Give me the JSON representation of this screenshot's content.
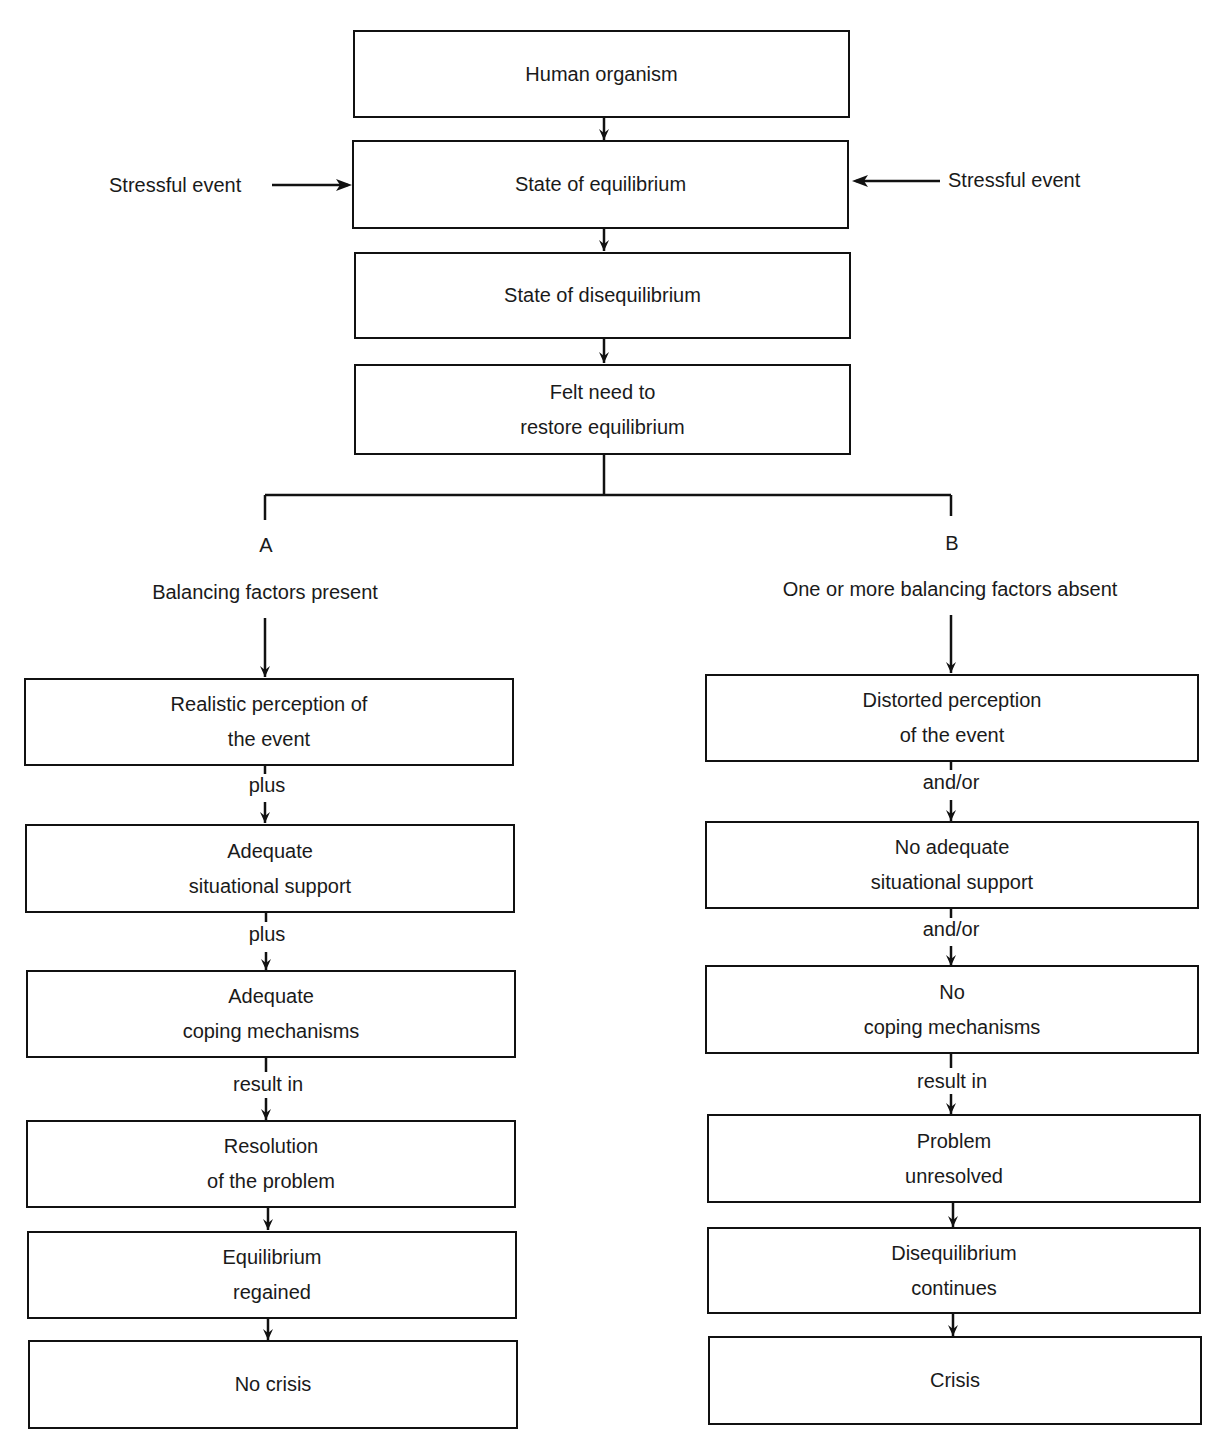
{
  "top_flow": {
    "human_organism": "Human organism",
    "state_equilibrium": "State of equilibrium",
    "state_disequilibrium": "State of disequilibrium",
    "felt_need_line1": "Felt need to",
    "felt_need_line2": "restore equilibrium"
  },
  "stressors": {
    "left": "Stressful event",
    "right": "Stressful event"
  },
  "branch_a": {
    "letter": "A",
    "heading": "Balancing factors present",
    "boxes": [
      {
        "line1": "Realistic perception of",
        "line2": "the event"
      },
      {
        "line1": "Adequate",
        "line2": "situational support"
      },
      {
        "line1": "Adequate",
        "line2": "coping mechanisms"
      },
      {
        "line1": "Resolution",
        "line2": "of the problem"
      },
      {
        "line1": "Equilibrium",
        "line2": "regained"
      },
      {
        "line1": "No crisis",
        "line2": ""
      }
    ],
    "connectors": [
      "plus",
      "plus",
      "result in"
    ]
  },
  "branch_b": {
    "letter": "B",
    "heading": "One or more balancing factors absent",
    "boxes": [
      {
        "line1": "Distorted perception",
        "line2": "of the event"
      },
      {
        "line1": "No adequate",
        "line2": "situational support"
      },
      {
        "line1": "No",
        "line2": "coping mechanisms"
      },
      {
        "line1": "Problem",
        "line2": "unresolved"
      },
      {
        "line1": "Disequilibrium",
        "line2": "continues"
      },
      {
        "line1": "Crisis",
        "line2": ""
      }
    ],
    "connectors": [
      "and/or",
      "and/or",
      "result in"
    ]
  },
  "colors": {
    "line": "#111111",
    "text": "#1a1a1a",
    "background": "#ffffff"
  }
}
